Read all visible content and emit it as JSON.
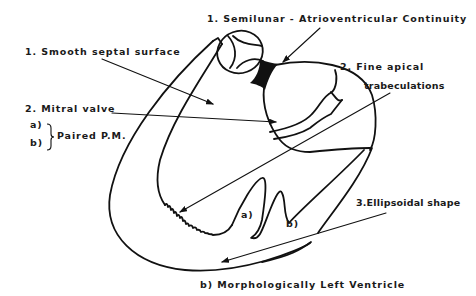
{
  "diagram": {
    "title": "b) Morphologically  Left Ventricle",
    "labels": {
      "semilunar": "1. Semilunar - Atrioventricular Continuity",
      "smooth_septal": "1. Smooth septal surface",
      "mitral_valve": "2. Mitral valve",
      "pm_a": "a)",
      "pm_b": "b)",
      "paired_pm": "Paired P.M.",
      "fine_apical_line1": "2. Fine  apical",
      "fine_apical_line2": "trabeculations",
      "ellipsoidal": "3.Ellipsoidal shape",
      "muscle_a": "a)",
      "muscle_b": "b)"
    },
    "colors": {
      "ink": "#111111",
      "background": "#ffffff"
    }
  }
}
